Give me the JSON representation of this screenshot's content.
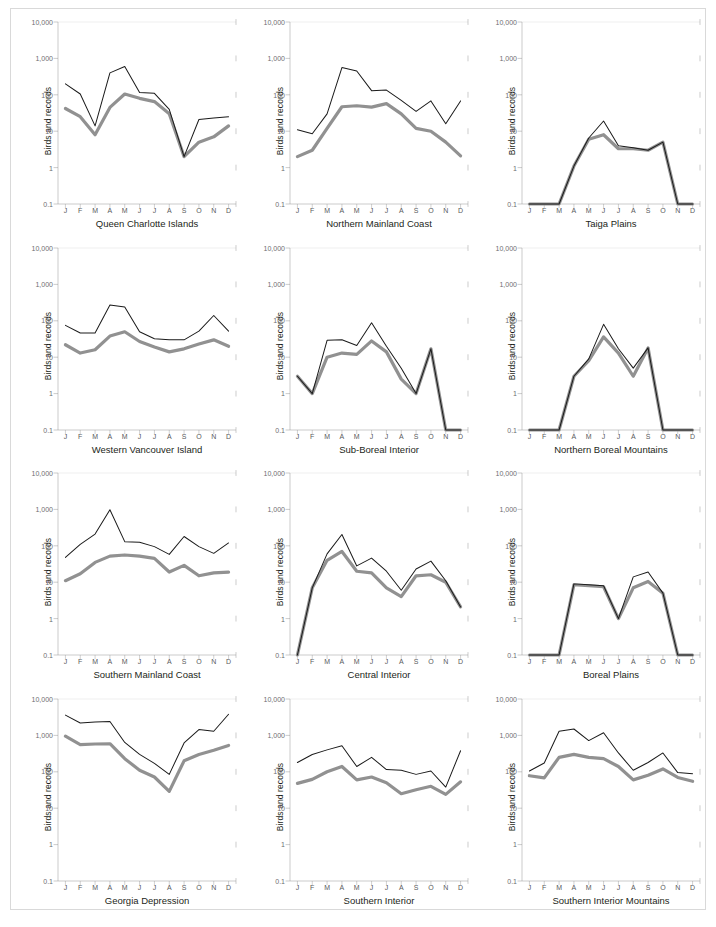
{
  "figure": {
    "ylabel": "Birds and records",
    "y_tick_labels": [
      "10,000",
      "1,000",
      "100",
      "10",
      "1",
      "0.1"
    ],
    "months": [
      "J",
      "F",
      "M",
      "A",
      "M",
      "J",
      "J",
      "A",
      "S",
      "O",
      "N",
      "D"
    ],
    "colors": {
      "line_black": "#1a1a1a",
      "line_gray": "#919191",
      "axis": "#8d8d8d",
      "gridline": "#d4d4d4",
      "border": "#d9d9d9",
      "tick_text": "#6d6e71",
      "title_text": "#231f20"
    },
    "series_names": [
      "records",
      "birds"
    ]
  },
  "chart_data": [
    {
      "type": "line",
      "title": "Queen Charlotte Islands",
      "xlabel": "",
      "ylabel": "Birds and records",
      "yscale": "log",
      "ylim": [
        0.1,
        10000
      ],
      "categories": [
        "J",
        "F",
        "M",
        "A",
        "M",
        "J",
        "J",
        "A",
        "S",
        "O",
        "N",
        "D"
      ],
      "series": [
        {
          "name": "records",
          "values": [
            200,
            105,
            14,
            400,
            600,
            115,
            110,
            40,
            2,
            21,
            23,
            25
          ]
        },
        {
          "name": "birds",
          "values": [
            42,
            25,
            8,
            45,
            105,
            80,
            65,
            30,
            2,
            5,
            7,
            14
          ]
        }
      ]
    },
    {
      "type": "line",
      "title": "Northern Mainland Coast",
      "xlabel": "",
      "ylabel": "Birds and records",
      "yscale": "log",
      "ylim": [
        0.1,
        10000
      ],
      "categories": [
        "J",
        "F",
        "M",
        "A",
        "M",
        "J",
        "J",
        "A",
        "S",
        "O",
        "N",
        "D"
      ],
      "series": [
        {
          "name": "records",
          "values": [
            11,
            8.5,
            30,
            560,
            450,
            130,
            135,
            70,
            35,
            68,
            16,
            68
          ]
        },
        {
          "name": "birds",
          "values": [
            2,
            3,
            12,
            47,
            50,
            46,
            57,
            30,
            12,
            10,
            5,
            2.1
          ]
        }
      ]
    },
    {
      "type": "line",
      "title": "Taiga Plains",
      "xlabel": "",
      "ylabel": "Birds and records",
      "yscale": "log",
      "ylim": [
        0.1,
        10000
      ],
      "categories": [
        "J",
        "F",
        "M",
        "A",
        "M",
        "J",
        "J",
        "A",
        "S",
        "O",
        "N",
        "D"
      ],
      "series": [
        {
          "name": "records",
          "values": [
            0.1,
            0.1,
            0.1,
            1.1,
            6.5,
            19,
            4,
            3.5,
            3,
            5,
            0.1,
            0.1
          ]
        },
        {
          "name": "birds",
          "values": [
            0.1,
            0.1,
            0.1,
            1.1,
            6.0,
            8,
            3.3,
            3.3,
            3,
            5,
            0.1,
            0.1
          ]
        }
      ]
    },
    {
      "type": "line",
      "title": "Western Vancouver Island",
      "xlabel": "",
      "ylabel": "Birds and records",
      "yscale": "log",
      "ylim": [
        0.1,
        10000
      ],
      "categories": [
        "J",
        "F",
        "M",
        "A",
        "M",
        "J",
        "J",
        "A",
        "S",
        "O",
        "N",
        "D"
      ],
      "series": [
        {
          "name": "records",
          "values": [
            75,
            46,
            46,
            270,
            240,
            50,
            32,
            30,
            30,
            52,
            140,
            52,
            360
          ]
        },
        {
          "name": "birds",
          "values": [
            22,
            13,
            16,
            38,
            50,
            27,
            19,
            14,
            17,
            23,
            30,
            20,
            19
          ]
        }
      ]
    },
    {
      "type": "line",
      "title": "Sub-Boreal Interior",
      "xlabel": "",
      "ylabel": "Birds and records",
      "yscale": "log",
      "ylim": [
        0.1,
        10000
      ],
      "categories": [
        "J",
        "F",
        "M",
        "A",
        "M",
        "J",
        "J",
        "A",
        "S",
        "O",
        "N",
        "D"
      ],
      "series": [
        {
          "name": "records",
          "values": [
            3,
            1,
            29,
            30,
            21,
            88,
            20,
            5,
            1,
            17,
            0.1,
            0.1
          ]
        },
        {
          "name": "birds",
          "values": [
            3,
            1,
            10,
            13,
            12,
            28,
            14,
            2.5,
            1,
            17,
            0.1,
            0.1
          ]
        }
      ]
    },
    {
      "type": "line",
      "title": "Northern Boreal Mountains",
      "xlabel": "",
      "ylabel": "Birds and records",
      "yscale": "log",
      "ylim": [
        0.1,
        10000
      ],
      "categories": [
        "J",
        "F",
        "M",
        "A",
        "M",
        "J",
        "J",
        "A",
        "S",
        "O",
        "N",
        "D"
      ],
      "series": [
        {
          "name": "records",
          "values": [
            0.1,
            0.1,
            0.1,
            3,
            9,
            80,
            17,
            5,
            18,
            0.1,
            0.1,
            0.1
          ]
        },
        {
          "name": "birds",
          "values": [
            0.1,
            0.1,
            0.1,
            3,
            8,
            36,
            13,
            3,
            18,
            0.1,
            0.1,
            0.1
          ]
        }
      ]
    },
    {
      "type": "line",
      "title": "Southern Mainland Coast",
      "xlabel": "",
      "ylabel": "Birds and records",
      "yscale": "log",
      "ylim": [
        0.1,
        10000
      ],
      "categories": [
        "J",
        "F",
        "M",
        "A",
        "M",
        "J",
        "J",
        "A",
        "S",
        "O",
        "N",
        "D"
      ],
      "series": [
        {
          "name": "records",
          "values": [
            48,
            110,
            210,
            980,
            130,
            125,
            95,
            58,
            180,
            95,
            62,
            120
          ]
        },
        {
          "name": "birds",
          "values": [
            11,
            17,
            35,
            52,
            56,
            52,
            45,
            19,
            29,
            15,
            18,
            19
          ]
        }
      ]
    },
    {
      "type": "line",
      "title": "Central Interior",
      "xlabel": "",
      "ylabel": "Birds and records",
      "yscale": "log",
      "ylim": [
        0.1,
        10000
      ],
      "categories": [
        "J",
        "F",
        "M",
        "A",
        "M",
        "J",
        "J",
        "A",
        "S",
        "O",
        "N",
        "D"
      ],
      "series": [
        {
          "name": "records",
          "values": [
            0.1,
            7,
            60,
            205,
            28,
            46,
            20,
            6,
            23,
            38,
            11,
            2.1
          ]
        },
        {
          "name": "birds",
          "values": [
            0.1,
            7,
            40,
            70,
            20,
            18,
            7,
            4,
            15,
            16,
            10,
            2.1
          ]
        }
      ]
    },
    {
      "type": "line",
      "title": "Boreal Plains",
      "xlabel": "",
      "ylabel": "Birds and records",
      "yscale": "log",
      "ylim": [
        0.1,
        10000
      ],
      "categories": [
        "J",
        "F",
        "M",
        "A",
        "M",
        "J",
        "J",
        "A",
        "S",
        "O",
        "N",
        "D"
      ],
      "series": [
        {
          "name": "records",
          "values": [
            0.1,
            0.1,
            0.1,
            9,
            8.5,
            8,
            1,
            14,
            19,
            5,
            0.1,
            0.1
          ]
        },
        {
          "name": "birds",
          "values": [
            0.1,
            0.1,
            0.1,
            8.5,
            8,
            7.5,
            1,
            7,
            10.5,
            5,
            0.1,
            0.1
          ]
        }
      ]
    },
    {
      "type": "line",
      "title": "Georgia Depression",
      "xlabel": "",
      "ylabel": "Birds and records",
      "yscale": "log",
      "ylim": [
        0.1,
        10000
      ],
      "categories": [
        "J",
        "F",
        "M",
        "A",
        "M",
        "J",
        "J",
        "A",
        "S",
        "O",
        "N",
        "D"
      ],
      "series": [
        {
          "name": "records",
          "values": [
            3600,
            2200,
            2350,
            2400,
            640,
            300,
            170,
            85,
            620,
            1450,
            1300,
            3800
          ]
        },
        {
          "name": "birds",
          "values": [
            950,
            560,
            580,
            590,
            230,
            110,
            72,
            29,
            200,
            300,
            390,
            530
          ]
        }
      ]
    },
    {
      "type": "line",
      "title": "Southern Interior",
      "xlabel": "",
      "ylabel": "Birds and records",
      "yscale": "log",
      "ylim": [
        0.1,
        10000
      ],
      "categories": [
        "J",
        "F",
        "M",
        "A",
        "M",
        "J",
        "J",
        "A",
        "S",
        "O",
        "N",
        "D"
      ],
      "series": [
        {
          "name": "records",
          "values": [
            180,
            300,
            400,
            520,
            140,
            250,
            115,
            110,
            85,
            105,
            38,
            380
          ]
        },
        {
          "name": "birds",
          "values": [
            48,
            62,
            100,
            140,
            60,
            72,
            50,
            25,
            32,
            40,
            24,
            53
          ]
        }
      ]
    },
    {
      "type": "line",
      "title": "Southern Interior Mountains",
      "xlabel": "",
      "ylabel": "Birds and records",
      "yscale": "log",
      "ylim": [
        0.1,
        10000
      ],
      "categories": [
        "J",
        "F",
        "M",
        "A",
        "M",
        "J",
        "J",
        "A",
        "S",
        "O",
        "N",
        "D"
      ],
      "series": [
        {
          "name": "records",
          "values": [
            105,
            175,
            1300,
            1500,
            720,
            1180,
            330,
            110,
            180,
            330,
            95,
            88
          ]
        },
        {
          "name": "birds",
          "values": [
            78,
            68,
            250,
            300,
            250,
            230,
            140,
            60,
            80,
            120,
            70,
            55
          ]
        }
      ]
    }
  ]
}
